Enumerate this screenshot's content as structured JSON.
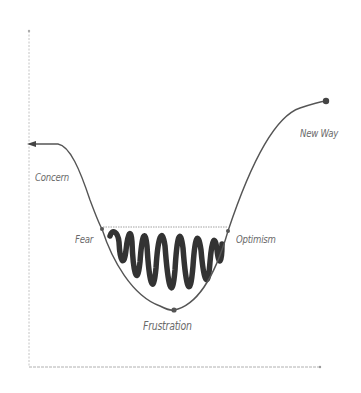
{
  "diagram": {
    "title": "",
    "type": "change-curve",
    "colors": {
      "curve": "#555555",
      "scribble": "#333333",
      "axis": "#bdbdbd",
      "label": "#6a6a6a",
      "dashed_line": "#8a8a8a"
    },
    "stages": [
      {
        "id": "concern",
        "label": "Concern"
      },
      {
        "id": "fear",
        "label": "Fear"
      },
      {
        "id": "frustration",
        "label": "Frustration"
      },
      {
        "id": "optimism",
        "label": "Optimism"
      },
      {
        "id": "new-way",
        "label": "New Way"
      }
    ]
  }
}
